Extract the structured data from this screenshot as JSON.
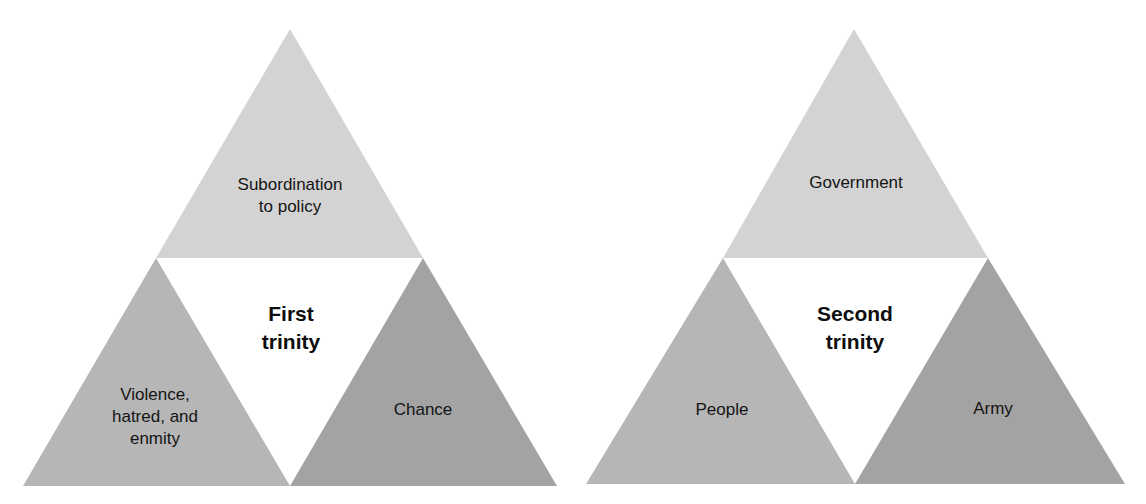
{
  "colors": {
    "top_triangle": "#d3d3d3",
    "left_triangle": "#b6b6b6",
    "right_triangle": "#a3a3a3",
    "center_triangle": "#ffffff",
    "text": "#141414",
    "background": "#ffffff"
  },
  "diagrams": [
    {
      "title": [
        "First",
        "trinity"
      ],
      "top": [
        "Subordination",
        "to policy"
      ],
      "left": [
        "Violence,",
        "hatred, and",
        "enmity"
      ],
      "right": [
        "Chance"
      ]
    },
    {
      "title": [
        "Second",
        "trinity"
      ],
      "top": [
        "Government"
      ],
      "left": [
        "People"
      ],
      "right": [
        "Army"
      ]
    }
  ]
}
